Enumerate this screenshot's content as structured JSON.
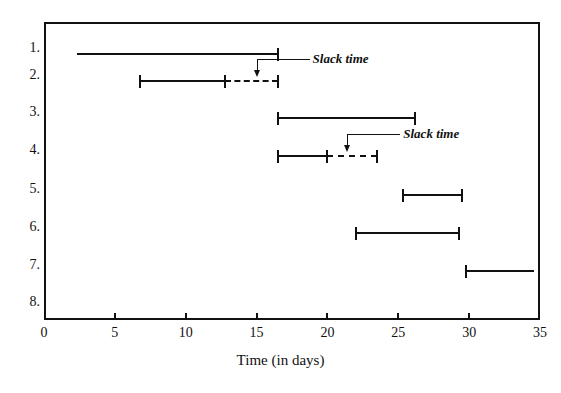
{
  "chart_data": {
    "type": "bar",
    "chart_style": "gantt",
    "title": "",
    "xlabel": "Time (in days)",
    "ylabel": "",
    "xlim": [
      0,
      35
    ],
    "xticks": [
      0,
      5,
      10,
      15,
      20,
      25,
      30,
      35
    ],
    "xtick_labels": [
      "0",
      "5",
      "10",
      "15",
      "20",
      "25",
      "30",
      "35"
    ],
    "grid": false,
    "legend": "none",
    "categories": [
      "1.",
      "2.",
      "3.",
      "4.",
      "5.",
      "6.",
      "7.",
      "8."
    ],
    "tasks": [
      {
        "row": "1.",
        "start": 2.3,
        "end": 16.5,
        "slack_end": null,
        "left_cap": false,
        "right_cap": true
      },
      {
        "row": "2.",
        "start": 6.8,
        "end": 12.8,
        "slack_end": 16.5,
        "left_cap": true,
        "right_cap": true
      },
      {
        "row": "3.",
        "start": 16.5,
        "end": 26.2,
        "slack_end": null,
        "left_cap": true,
        "right_cap": true
      },
      {
        "row": "4.",
        "start": 16.5,
        "end": 20.0,
        "slack_end": 23.5,
        "left_cap": true,
        "right_cap": true
      },
      {
        "row": "5.",
        "start": 25.3,
        "end": 29.5,
        "slack_end": null,
        "left_cap": true,
        "right_cap": true
      },
      {
        "row": "6.",
        "start": 22.0,
        "end": 29.3,
        "slack_end": null,
        "left_cap": true,
        "right_cap": true
      },
      {
        "row": "7.",
        "start": 29.8,
        "end": 34.6,
        "slack_end": null,
        "left_cap": true,
        "right_cap": false
      },
      {
        "row": "8.",
        "start": null,
        "end": null,
        "slack_end": null,
        "left_cap": false,
        "right_cap": false
      }
    ],
    "annotations": [
      {
        "text": "Slack time",
        "points_to_row": "2.",
        "points_to_day": 15.0
      },
      {
        "text": "Slack time",
        "points_to_row": "4.",
        "points_to_day": 21.4
      }
    ],
    "colors": {
      "ink": "#111111",
      "background": "#ffffff"
    }
  }
}
